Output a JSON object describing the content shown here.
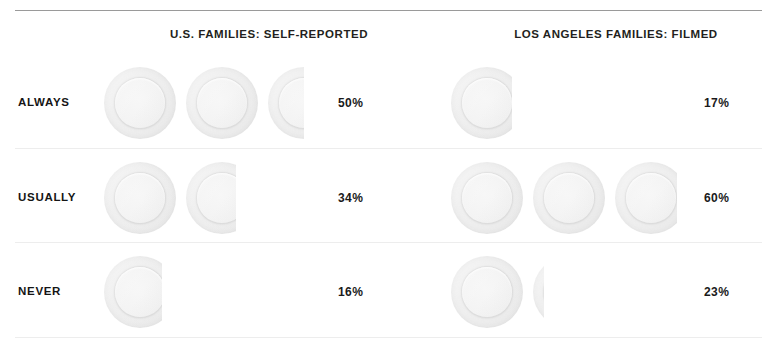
{
  "chart_data": {
    "type": "bar",
    "title": "",
    "subtitle": "",
    "xlabel": "",
    "ylabel": "",
    "unit_label": "plate",
    "unit_value_percent": 20,
    "grid": false,
    "legend_position": "none",
    "categories": [
      "ALWAYS",
      "USUALLY",
      "NEVER"
    ],
    "series": [
      {
        "name": "U.S. FAMILIES: SELF-REPORTED",
        "values": [
          50,
          34,
          16
        ],
        "value_labels": [
          "50%",
          "34%",
          "16%"
        ],
        "units": [
          2.5,
          1.7,
          0.8
        ]
      },
      {
        "name": "LOS ANGELES FAMILIES: FILMED",
        "values": [
          17,
          60,
          23
        ],
        "value_labels": [
          "17%",
          "60%",
          "23%"
        ],
        "units": [
          0.85,
          3.0,
          1.15
        ]
      }
    ]
  },
  "headers": {
    "left": "U.S. FAMILIES: SELF-REPORTED",
    "right": "LOS ANGELES FAMILIES: FILMED"
  },
  "rows": [
    {
      "label": "ALWAYS",
      "left_pct": "50%",
      "right_pct": "17%",
      "left_units": 2.5,
      "right_units": 0.85
    },
    {
      "label": "USUALLY",
      "left_pct": "34%",
      "right_pct": "60%",
      "left_units": 1.7,
      "right_units": 3.0
    },
    {
      "label": "NEVER",
      "left_pct": "16%",
      "right_pct": "23%",
      "left_units": 0.8,
      "right_units": 1.15
    }
  ],
  "colors": {
    "text": "#1a1a1a",
    "top_rule": "#9a9a9a",
    "row_divider": "#ededed",
    "plate_rim": "#e4e4e4",
    "plate_face": "#f2f2f2",
    "background": "#ffffff"
  }
}
